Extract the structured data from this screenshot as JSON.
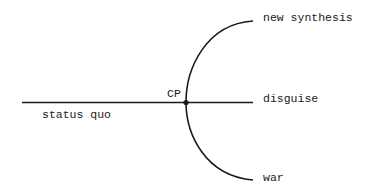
{
  "diagram": {
    "type": "branching-path",
    "nodes": {
      "critical_point": "CP"
    },
    "labels": {
      "status_quo": "status quo",
      "new_synthesis": "new synthesis",
      "disguise": "disguise",
      "war": "war"
    },
    "edges": [
      {
        "from": "status quo",
        "to": "CP"
      },
      {
        "from": "CP",
        "to": "new synthesis"
      },
      {
        "from": "CP",
        "to": "disguise"
      },
      {
        "from": "CP",
        "to": "war"
      }
    ],
    "colors": {
      "line": "#1a1a1a",
      "background": "#ffffff"
    }
  }
}
